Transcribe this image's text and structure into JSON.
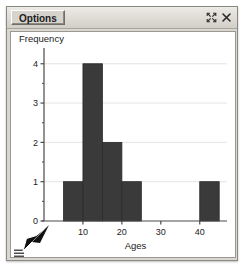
{
  "window": {
    "title_tab_label": "Options",
    "buttons": [
      {
        "name": "maximize",
        "glyph": "expand-icon",
        "title": "Maximize"
      },
      {
        "name": "close",
        "glyph": "close-icon",
        "title": "Close"
      }
    ],
    "menu_handle_label": "menu-icon",
    "cursor_label": "mouse-cursor"
  },
  "colors": {
    "bar_fill": "#3a3a3a",
    "bar_stroke": "#2a2a2a",
    "axis": "#4a4a4a",
    "gridline": "#e4e4e4",
    "plot_bg": "#ffffff",
    "chrome_bg": "#d9d7d0",
    "text": "#1b1b1b"
  },
  "chart_data": {
    "type": "bar",
    "title": "",
    "xlabel": "Ages",
    "ylabel": "Frequency",
    "xlim": [
      0,
      47
    ],
    "ylim": [
      0,
      4.35
    ],
    "xticks": [
      10,
      20,
      30,
      40
    ],
    "xticklabels": [
      "10",
      "20",
      "30",
      "40"
    ],
    "yticks": [
      0,
      1,
      2,
      3,
      4
    ],
    "yticklabels": [
      "0",
      "1",
      "2",
      "3",
      "4"
    ],
    "grid": true,
    "grid_axis": "y",
    "legend": false,
    "bin_width": 5,
    "bins": [
      {
        "x0": 5,
        "x1": 10,
        "value": 1
      },
      {
        "x0": 10,
        "x1": 15,
        "value": 4
      },
      {
        "x0": 15,
        "x1": 20,
        "value": 2
      },
      {
        "x0": 20,
        "x1": 25,
        "value": 1
      },
      {
        "x0": 40,
        "x1": 45,
        "value": 1
      }
    ],
    "categories": [
      "5-10",
      "10-15",
      "15-20",
      "20-25",
      "40-45"
    ],
    "values": [
      1,
      4,
      2,
      1,
      1
    ]
  }
}
